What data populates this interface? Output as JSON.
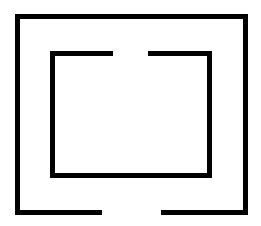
{
  "canvas": {
    "width": 261,
    "height": 226,
    "background": "#ffffff"
  },
  "stroke": {
    "color": "#000000",
    "width": 5
  },
  "shapes": {
    "outer_rect": {
      "left": 17.5,
      "top": 16.5,
      "right": 245.5,
      "bottom": 212.5,
      "bottom_gap": {
        "from_x": 102,
        "to_x": 161
      }
    },
    "inner_rect": {
      "left": 52.5,
      "top": 53.5,
      "right": 209.5,
      "bottom": 175.5,
      "top_gap": {
        "from_x": 113,
        "to_x": 148
      }
    }
  }
}
